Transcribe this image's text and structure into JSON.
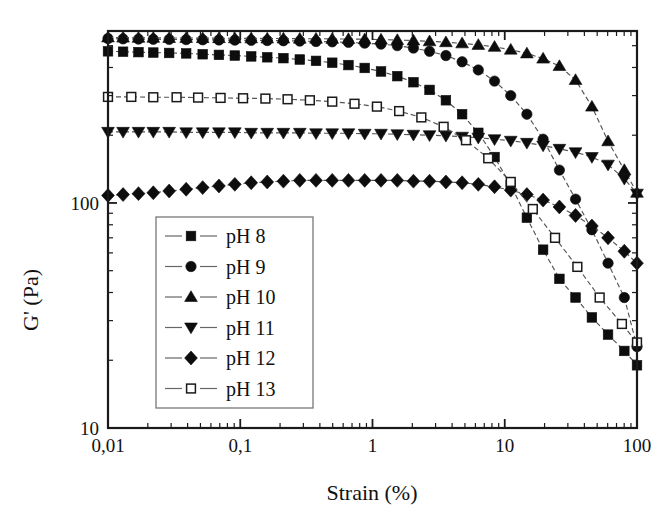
{
  "chart_data": {
    "type": "line",
    "title": "",
    "subtitle": "",
    "xlabel": "Strain (%)",
    "ylabel": "G' (Pa)",
    "xscale": "log",
    "yscale": "log",
    "xlim": [
      0.01,
      100
    ],
    "ylim": [
      10,
      581
    ],
    "grid": false,
    "legend_position": "lower-left-inside",
    "xtick_labels": [
      "0,01",
      "0,1",
      "1",
      "10",
      "100"
    ],
    "xtick_values": [
      0.01,
      0.1,
      1,
      10,
      100
    ],
    "ytick_labels": [
      "10",
      "100"
    ],
    "ytick_values": [
      10,
      100
    ],
    "decimal_separator": "comma",
    "series": [
      {
        "name": "pH 8",
        "marker": "filled-square",
        "line_style": "dashed",
        "x": [
          0.01,
          0.013,
          0.017,
          0.022,
          0.029,
          0.039,
          0.052,
          0.069,
          0.091,
          0.121,
          0.16,
          0.212,
          0.282,
          0.374,
          0.496,
          0.658,
          0.873,
          1.16,
          1.54,
          2.04,
          2.7,
          3.59,
          4.76,
          6.31,
          8.37,
          11.1,
          14.7,
          19.5,
          25.9,
          34.3,
          45.6,
          60.4,
          80.2,
          100.0
        ],
        "y": [
          472,
          470,
          468,
          466,
          464,
          462,
          458,
          455,
          452,
          448,
          444,
          440,
          434,
          428,
          420,
          410,
          398,
          384,
          366,
          344,
          318,
          286,
          248,
          205,
          160,
          120,
          86,
          62,
          46,
          38,
          31,
          26,
          22,
          19
        ]
      },
      {
        "name": "pH 9",
        "marker": "filled-circle",
        "line_style": "dashed",
        "x": [
          0.01,
          0.013,
          0.017,
          0.022,
          0.029,
          0.039,
          0.052,
          0.069,
          0.091,
          0.121,
          0.16,
          0.212,
          0.282,
          0.374,
          0.496,
          0.658,
          0.873,
          1.16,
          1.54,
          2.04,
          2.7,
          3.59,
          4.76,
          6.31,
          8.37,
          11.1,
          14.7,
          19.5,
          25.9,
          34.3,
          45.6,
          60.4,
          80.2,
          100.0
        ],
        "y": [
          538,
          536,
          535,
          534,
          533,
          532,
          531,
          530,
          529,
          528,
          527,
          526,
          524,
          522,
          520,
          517,
          513,
          508,
          500,
          488,
          472,
          452,
          424,
          390,
          348,
          300,
          248,
          192,
          140,
          104,
          76,
          54,
          38,
          23
        ]
      },
      {
        "name": "pH 10",
        "marker": "filled-triangle-up",
        "line_style": "dashed",
        "x": [
          0.01,
          0.013,
          0.017,
          0.022,
          0.029,
          0.039,
          0.052,
          0.069,
          0.091,
          0.121,
          0.16,
          0.212,
          0.282,
          0.374,
          0.496,
          0.658,
          0.873,
          1.16,
          1.54,
          2.04,
          2.7,
          3.59,
          4.76,
          6.31,
          8.37,
          11.1,
          14.7,
          19.5,
          25.9,
          34.3,
          45.6,
          60.4,
          80.2,
          100.0
        ],
        "y": [
          544,
          543,
          542,
          542,
          541,
          541,
          540,
          540,
          539,
          539,
          538,
          538,
          537,
          537,
          536,
          535,
          534,
          532,
          530,
          527,
          523,
          518,
          512,
          504,
          494,
          480,
          462,
          438,
          406,
          352,
          268,
          188,
          140,
          111
        ]
      },
      {
        "name": "pH 11",
        "marker": "filled-triangle-down",
        "line_style": "dashed",
        "x": [
          0.01,
          0.013,
          0.017,
          0.022,
          0.029,
          0.039,
          0.052,
          0.069,
          0.091,
          0.121,
          0.16,
          0.212,
          0.282,
          0.374,
          0.496,
          0.658,
          0.873,
          1.16,
          1.54,
          2.04,
          2.7,
          3.59,
          4.76,
          6.31,
          8.37,
          11.1,
          14.7,
          19.5,
          25.9,
          34.3,
          45.6,
          60.4,
          80.2,
          100.0
        ],
        "y": [
          207,
          207,
          207,
          207,
          207,
          206,
          206,
          206,
          206,
          205,
          205,
          205,
          205,
          204,
          204,
          204,
          203,
          203,
          202,
          201,
          200,
          199,
          197,
          195,
          192,
          189,
          185,
          180,
          174,
          168,
          160,
          148,
          128,
          110
        ]
      },
      {
        "name": "pH 12",
        "marker": "filled-diamond",
        "line_style": "dashed",
        "x": [
          0.01,
          0.013,
          0.017,
          0.022,
          0.029,
          0.039,
          0.052,
          0.069,
          0.091,
          0.121,
          0.16,
          0.212,
          0.282,
          0.374,
          0.496,
          0.658,
          0.873,
          1.16,
          1.54,
          2.04,
          2.7,
          3.59,
          4.76,
          6.31,
          8.37,
          11.1,
          14.7,
          19.5,
          25.9,
          34.3,
          45.6,
          60.4,
          80.2,
          100.0
        ],
        "y": [
          108,
          109,
          110,
          111,
          113,
          115,
          117,
          119,
          121,
          123,
          124,
          125,
          126,
          126,
          126,
          126,
          126,
          126,
          126,
          125,
          125,
          124,
          123,
          121,
          118,
          114,
          109,
          103,
          96,
          88,
          79,
          70,
          61,
          54
        ]
      },
      {
        "name": "pH 13",
        "marker": "open-square",
        "line_style": "dashed",
        "x": [
          0.01,
          0.015,
          0.022,
          0.033,
          0.048,
          0.071,
          0.105,
          0.155,
          0.228,
          0.336,
          0.496,
          0.731,
          1.08,
          1.59,
          2.34,
          3.45,
          5.09,
          7.5,
          11.1,
          16.3,
          24.0,
          35.4,
          52.2,
          76.9,
          100.0
        ],
        "y": [
          296,
          296,
          295,
          295,
          294,
          293,
          292,
          291,
          289,
          286,
          282,
          276,
          268,
          256,
          240,
          218,
          190,
          158,
          124,
          94,
          70,
          52,
          38,
          29,
          24
        ]
      }
    ]
  },
  "axes": {
    "x_title": "Strain (%)",
    "y_title": "G' (Pa)"
  },
  "legend": {
    "entries": [
      {
        "label": "pH 8",
        "marker": "filled-square"
      },
      {
        "label": "pH 9",
        "marker": "filled-circle"
      },
      {
        "label": "pH 10",
        "marker": "filled-triangle-up"
      },
      {
        "label": "pH 11",
        "marker": "filled-triangle-down"
      },
      {
        "label": "pH 12",
        "marker": "filled-diamond"
      },
      {
        "label": "pH 13",
        "marker": "open-square"
      }
    ]
  },
  "colors": {
    "marker_filled": "#0d0d0d",
    "marker_open_fill": "#ffffff",
    "axis": "#1a1a1a",
    "line": "#555555",
    "background": "#ffffff"
  }
}
